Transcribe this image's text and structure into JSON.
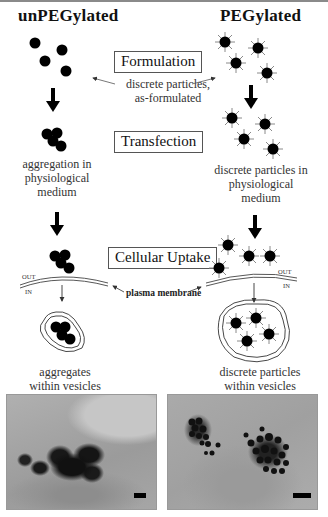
{
  "columns": {
    "left_heading": "unPEGylated",
    "right_heading": "PEGylated"
  },
  "stages": [
    {
      "label": "Formulation"
    },
    {
      "label": "Transfection"
    },
    {
      "label": "Cellular Uptake"
    }
  ],
  "captions": {
    "formulation_center_line1": "discrete particles,",
    "formulation_center_line2": "as-formulated",
    "left_transfection_line1": "aggregation in",
    "left_transfection_line2": "physiological",
    "left_transfection_line3": "medium",
    "right_transfection_line1": "discrete particles in",
    "right_transfection_line2": "physiological",
    "right_transfection_line3": "medium",
    "membrane_label": "plasma membrane",
    "out_label": "OUT",
    "in_label": "IN",
    "left_uptake_line1": "aggregates",
    "left_uptake_line2": "within vesicles",
    "right_uptake_line1": "discrete particles",
    "right_uptake_line2": "within vesicles"
  },
  "micrographs": [
    {
      "name": "unpegylated-tem",
      "description": "aggregated dark particles in cell",
      "scale_bar": true
    },
    {
      "name": "pegylated-tem",
      "description": "discrete dark particles inside vesicles",
      "scale_bar": true
    }
  ],
  "colors": {
    "particle": "#000000",
    "spike": "#777777",
    "box_border": "#555555",
    "caption_text": "#333333",
    "micrograph_gray": "#a8a8a8"
  }
}
